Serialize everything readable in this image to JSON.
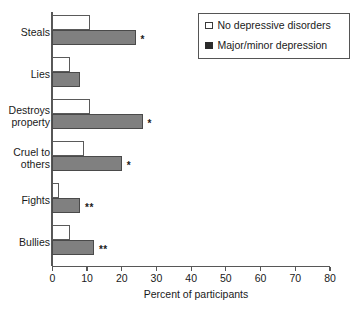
{
  "chart_data": {
    "type": "bar",
    "orientation": "horizontal",
    "title": "",
    "xlabel": "Percent of participants",
    "ylabel": "",
    "xlim": [
      0,
      80
    ],
    "xticks": [
      0,
      10,
      20,
      30,
      40,
      50,
      60,
      70,
      80
    ],
    "grid": false,
    "legend_position": "top-right",
    "categories": [
      "Steals",
      "Lies",
      "Destroys\nproperty",
      "Cruel to\nothers",
      "Fights",
      "Bullies"
    ],
    "series": [
      {
        "name": "No depressive disorders",
        "swatch": "light",
        "values": [
          11,
          5,
          11,
          9,
          2,
          5
        ]
      },
      {
        "name": "Major/minor depression",
        "swatch": "dark",
        "values": [
          24,
          8,
          26,
          20,
          8,
          12
        ]
      }
    ],
    "annotations": [
      {
        "category": "Steals",
        "marker": "*"
      },
      {
        "category": "Lies",
        "marker": ""
      },
      {
        "category": "Destroys\nproperty",
        "marker": "*"
      },
      {
        "category": "Cruel to\nothers",
        "marker": "*"
      },
      {
        "category": "Fights",
        "marker": "**"
      },
      {
        "category": "Bullies",
        "marker": "**"
      }
    ]
  },
  "axis": {
    "x_title": "Percent of participants",
    "tick_labels": [
      "0",
      "10",
      "20",
      "30",
      "40",
      "50",
      "60",
      "70",
      "80"
    ],
    "category_labels": [
      "Steals",
      "Lies",
      "Destroys\nproperty",
      "Cruel to\nothers",
      "Fights",
      "Bullies"
    ]
  },
  "legend": {
    "entries": [
      {
        "label": "No depressive disorders",
        "style": "light"
      },
      {
        "label": "Major/minor depression",
        "style": "dark"
      }
    ]
  },
  "significance": {
    "steals": "*",
    "lies": "",
    "destroys_property": "*",
    "cruel_to_others": "*",
    "fights": "**",
    "bullies": "**"
  },
  "colors": {
    "bar_light_fill": "#ffffff",
    "bar_dark_fill": "#808080",
    "bar_stroke": "#4a4a4a",
    "axis": "#575757",
    "text": "#1a1a1a",
    "legend_dark_swatch": "#2b2b2b"
  }
}
